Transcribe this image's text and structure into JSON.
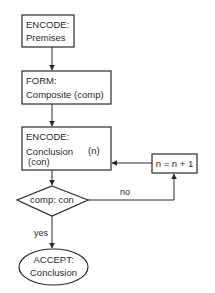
{
  "flowchart": {
    "nodes": {
      "encode_premises": {
        "type": "rectangle",
        "line1": "ENCODE:",
        "line2": "Premises"
      },
      "form_composite": {
        "type": "rectangle",
        "line1": "FORM:",
        "line2": "Composite (comp)"
      },
      "encode_conclusion": {
        "type": "rectangle",
        "line1": "ENCODE:",
        "line2": "Conclusion",
        "index": "(n)",
        "line3": "(con)"
      },
      "increment": {
        "type": "rectangle",
        "label": "n = n + 1"
      },
      "compare": {
        "type": "diamond",
        "label": "comp: con"
      },
      "accept": {
        "type": "ellipse",
        "line1": "ACCEPT:",
        "line2": "Conclusion"
      }
    },
    "edges": {
      "no_label": "no",
      "yes_label": "yes"
    },
    "colors": {
      "stroke": "#2a2a2a",
      "background": "#ffffff"
    }
  }
}
